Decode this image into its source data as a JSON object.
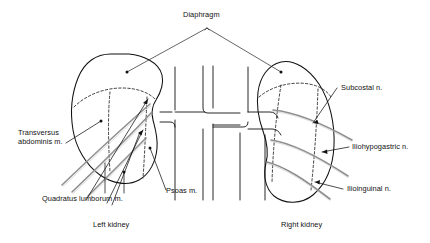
{
  "figure": {
    "type": "anatomical-line-diagram",
    "background_color": "#ffffff",
    "outline_color": "#111111",
    "nerve_color": "#8c8c8c",
    "leader_color": "#111111",
    "dashed_color": "#111111"
  },
  "labels": {
    "diaphragm": "Diaphragm",
    "transversus": "Transversus\nabdominis m.",
    "quadratus": "Quadratus lumborum m.",
    "psoas": "Psoas m.",
    "subcostal": "Subcostal n.",
    "iliohypogastric": "Iliohypogastric n.",
    "ilioinguinal": "Ilioinguinal n.",
    "left_kidney": "Left kidney",
    "right_kidney": "Right kidney"
  },
  "structures": {
    "left_kidney_name": "left-kidney-outline",
    "right_kidney_name": "right-kidney-outline",
    "vertebral_column_name": "vertebral-column",
    "nerves": [
      "subcostal-nerve",
      "iliohypogastric-nerve",
      "ilioinguinal-nerve"
    ]
  }
}
